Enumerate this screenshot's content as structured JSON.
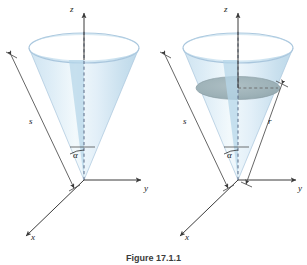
{
  "figure": {
    "caption": "Figure 17.1.1",
    "background_color": "#ffffff"
  },
  "colors": {
    "cone_fill_light": "#dceaf5",
    "cone_fill_mid": "#c2dcec",
    "cone_fill_pale": "#eef6fb",
    "cone_rim_stroke": "#a9c6dd",
    "disk_fill": "#9fb3b8",
    "axis_stroke": "#3a3a3a",
    "dashed_axis_stroke": "#5b6a86",
    "label_color": "#1a1a1a"
  },
  "panels": [
    {
      "id": "left-cone",
      "name": "cone-without-disk",
      "axes": {
        "z_label": "z",
        "y_label": "y",
        "x_label": "x"
      },
      "labels": {
        "slant_label": "s",
        "angle_label": "α"
      },
      "has_disk": false
    },
    {
      "id": "right-cone",
      "name": "cone-with-disk",
      "axes": {
        "z_label": "z",
        "y_label": "y",
        "x_label": "x"
      },
      "labels": {
        "slant_label": "s",
        "angle_label": "α",
        "radius_label": "r"
      },
      "has_disk": true
    }
  ]
}
